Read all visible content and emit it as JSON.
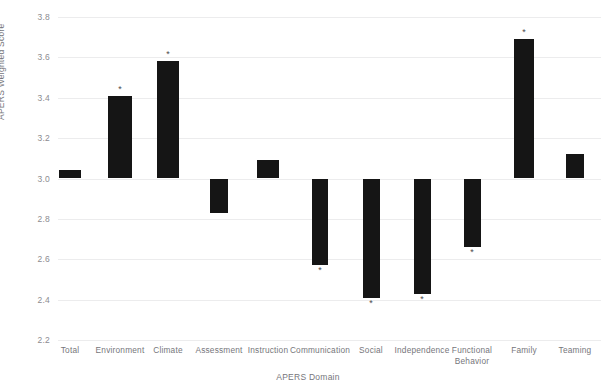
{
  "chart_data": {
    "type": "bar",
    "title": "",
    "xlabel": "APERS Domain",
    "ylabel": "APERS Weighted Score",
    "ylim": [
      2.2,
      3.8
    ],
    "baseline": 3.0,
    "grid": true,
    "legend": "none",
    "ytick_labels": [
      "3.8",
      "3.6",
      "3.4",
      "3.2",
      "3.0",
      "2.8",
      "2.6",
      "2.4",
      "2.2"
    ],
    "ytick_values": [
      3.8,
      3.6,
      3.4,
      3.2,
      3.0,
      2.8,
      2.6,
      2.4,
      2.2
    ],
    "categories": [
      "Total",
      "Environment",
      "Climate",
      "Assessment",
      "Instruction",
      "Communication",
      "Social",
      "Independence",
      "Functional\nBehavior",
      "Family",
      "Teaming"
    ],
    "values": [
      3.04,
      3.41,
      3.58,
      2.83,
      3.09,
      2.57,
      2.41,
      2.43,
      2.66,
      3.69,
      3.12
    ],
    "significance": [
      false,
      true,
      true,
      false,
      false,
      true,
      true,
      true,
      true,
      true,
      false
    ],
    "significance_marker": "*",
    "bar_color": "#151515"
  },
  "axis": {
    "y_title": "APERS Weighted Score",
    "x_title": "APERS Domain"
  }
}
